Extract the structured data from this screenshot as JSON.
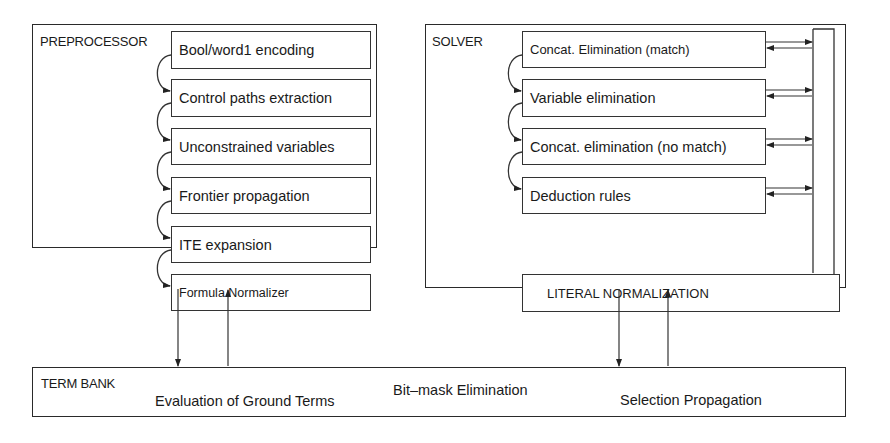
{
  "preprocessor": {
    "title": "PREPROCESSOR",
    "steps": [
      "Bool/word1 encoding",
      "Control paths extraction",
      "Unconstrained variables",
      "Frontier propagation",
      "ITE expansion",
      "Formula Normalizer"
    ]
  },
  "solver": {
    "title": "SOLVER",
    "steps": [
      "Concat. Elimination (match)",
      "Variable elimination",
      "Concat. elimination (no match)",
      "Deduction rules"
    ],
    "normalizer": "LITERAL NORMALIZATION"
  },
  "term_bank": {
    "title": "TERM BANK",
    "items": [
      "Evaluation of Ground Terms",
      "Bit–mask Elimination",
      "Selection Propagation"
    ]
  }
}
